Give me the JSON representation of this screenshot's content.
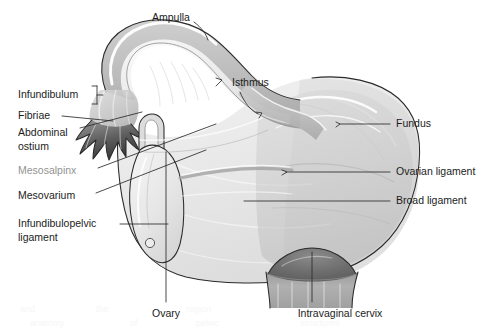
{
  "figure": {
    "background_color": "#ffffff",
    "ink_color": "#1c1c1c"
  },
  "palette": {
    "outline": "#2a2a2a",
    "leader": "#2b2b2b",
    "broad_ligament": "#e9e9e9",
    "uterus_body": "#d2d2d2",
    "tube_wall": "#c2c2c2",
    "tube_lumen": "#ededed",
    "ovary": "#e4e4e4",
    "cervix_dark": "#6e6e6e",
    "vagina_wall": "#a8a8a8",
    "fimbriae": "#555555"
  },
  "labels": {
    "left": [
      {
        "id": "infundibulum",
        "text": "Infundibulum",
        "lines": [
          "Infundibulum"
        ],
        "x": 18,
        "y": 95,
        "leader": "bracket"
      },
      {
        "id": "fibriae",
        "text": "Fibriae",
        "lines": [
          "Fibriae"
        ],
        "x": 18,
        "y": 116,
        "leader": "horizontal"
      },
      {
        "id": "abdominal-ostium",
        "text": "Abdominal ostium",
        "lines": [
          "Abdominal",
          "ostium"
        ],
        "x": 18,
        "y": 133,
        "leader": "diagonal"
      },
      {
        "id": "mesosalpinx",
        "text": "Mesosalpinx",
        "lines": [
          "Mesosalpinx"
        ],
        "x": 18,
        "y": 171,
        "leader": "diagonal",
        "faded": true
      },
      {
        "id": "mesovarium",
        "text": "Mesovarium",
        "lines": [
          "Mesovarium"
        ],
        "x": 18,
        "y": 196,
        "leader": "diagonal"
      },
      {
        "id": "infundibulopelvic-ligament",
        "text": "Infundibulopelvic ligament",
        "lines": [
          "Infundibulopelvic",
          "ligament"
        ],
        "x": 18,
        "y": 224,
        "leader": "horizontal"
      }
    ],
    "right": [
      {
        "id": "fundus",
        "text": "Fundus",
        "lines": [
          "Fundus"
        ],
        "x": 396,
        "y": 124,
        "leader": "horizontal"
      },
      {
        "id": "ovarian-ligament",
        "text": "Ovarian ligament",
        "lines": [
          "Ovarian ligament"
        ],
        "x": 396,
        "y": 172,
        "leader": "horizontal"
      },
      {
        "id": "broad-ligament",
        "text": "Broad ligament",
        "lines": [
          "Broad ligament"
        ],
        "x": 396,
        "y": 201,
        "leader": "horizontal"
      }
    ],
    "top": [
      {
        "id": "ampulla",
        "text": "Ampulla",
        "lines": [
          "Ampulla"
        ],
        "x": 152,
        "y": 18,
        "leader": "curve"
      },
      {
        "id": "isthmus",
        "text": "Isthmus",
        "lines": [
          "Isthmus"
        ],
        "x": 232,
        "y": 83,
        "leader": "bracket-curve"
      }
    ],
    "bottom": [
      {
        "id": "ovary",
        "text": "Ovary",
        "lines": [
          "Ovary"
        ],
        "x": 166,
        "y": 314,
        "leader": "vertical"
      },
      {
        "id": "intravaginal-cervix",
        "text": "Intravaginal cervix",
        "lines": [
          "Intravaginal cervix"
        ],
        "x": 277,
        "y": 314,
        "leader": "vertical"
      }
    ]
  },
  "structures": [
    {
      "id": "ampulla-tube",
      "name": "Ampulla of uterine tube"
    },
    {
      "id": "isthmus-tube",
      "name": "Isthmus of uterine tube"
    },
    {
      "id": "infundibulum-region",
      "name": "Infundibulum"
    },
    {
      "id": "fimbriae-fringe",
      "name": "Fimbriae"
    },
    {
      "id": "abdominal-ostium-opening",
      "name": "Abdominal ostium"
    },
    {
      "id": "ovary-body",
      "name": "Ovary"
    },
    {
      "id": "broad-ligament-sheet",
      "name": "Broad ligament"
    },
    {
      "id": "mesosalpinx-region",
      "name": "Mesosalpinx"
    },
    {
      "id": "mesovarium-region",
      "name": "Mesovarium"
    },
    {
      "id": "uterus-fundus",
      "name": "Fundus of uterus"
    },
    {
      "id": "ovarian-ligament-cord",
      "name": "Ovarian ligament"
    },
    {
      "id": "cervix-dome",
      "name": "Intravaginal cervix"
    },
    {
      "id": "vagina-wall",
      "name": "Vaginal wall"
    }
  ]
}
